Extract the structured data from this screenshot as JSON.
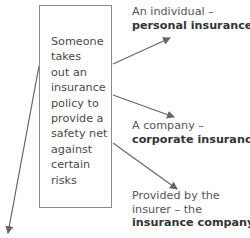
{
  "diagram": {
    "central_box": {
      "text": "Someone takes out an insurance policy to provide a safety net against certain risks",
      "lines": [
        "Someone",
        "takes",
        "out an",
        "insurance",
        "policy to",
        "provide a",
        "safety net",
        "against",
        "certain",
        "risks"
      ]
    },
    "branches": [
      {
        "prefix": "An individual –",
        "term": "personal insurance"
      },
      {
        "prefix": "A company –",
        "term": "corporate insurance"
      },
      {
        "prefix_line1": "Provided by the",
        "prefix_line2": "insurer – the",
        "term": "insurance company"
      }
    ],
    "colors": {
      "border": "#8a8a8a",
      "arrow": "#666666",
      "text": "#4a4a4a",
      "bold_text": "#333333"
    }
  }
}
